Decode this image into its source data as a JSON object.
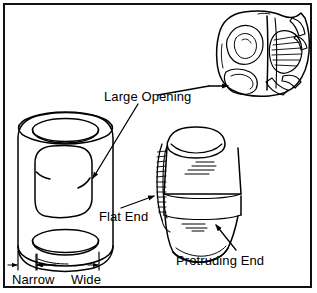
{
  "figure": {
    "type": "technical-line-illustration",
    "background_color": "#ffffff",
    "line_color": "#000000",
    "border_color": "#111111",
    "width": 317,
    "height": 293
  },
  "labels": {
    "large_opening": "Large Opening",
    "flat_end": "Flat End",
    "protruding_end": "Protruding End",
    "narrow": "Narrow",
    "wide": "Wide"
  },
  "parts": [
    {
      "id": "yoke",
      "name": "yoke-part",
      "position": "top-right",
      "described_by": "large_opening"
    },
    {
      "id": "bearing-cup",
      "name": "bearing-cup-part",
      "position": "left",
      "described_by": "large_opening"
    },
    {
      "id": "spool-roller",
      "name": "spool-roller-part",
      "position": "center-right",
      "described_by": "flat_end, protruding_end"
    }
  ],
  "annotations": [
    {
      "name": "leader-large-opening-to-yoke",
      "label": "large_opening",
      "target": "yoke",
      "style": "horizontal-leader-arrow"
    },
    {
      "name": "leader-large-opening-to-cup",
      "label": "large_opening",
      "target": "bearing-cup",
      "style": "diagonal-arrow"
    },
    {
      "name": "leader-flat-end",
      "label": "flat_end",
      "target": "spool-roller",
      "style": "diagonal-arrow"
    },
    {
      "name": "leader-protruding-end",
      "label": "protruding_end",
      "target": "spool-roller",
      "style": "diagonal-leader"
    },
    {
      "name": "dimension-narrow",
      "label": "narrow",
      "target": "bearing-cup",
      "style": "dimension-arrows"
    },
    {
      "name": "dimension-wide",
      "label": "wide",
      "target": "bearing-cup",
      "style": "dimension-arrows"
    }
  ]
}
